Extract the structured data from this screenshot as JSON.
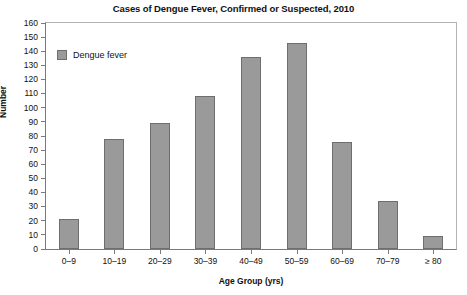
{
  "chart_data": {
    "type": "bar",
    "title": "Cases of Dengue Fever, Confirmed or Suspected, 2010",
    "xlabel": "Age Group (yrs)",
    "ylabel": "Number",
    "categories": [
      "0–9",
      "10–19",
      "20–29",
      "30–39",
      "40–49",
      "50–59",
      "60–69",
      "70–79",
      "≥ 80"
    ],
    "values": [
      21,
      78,
      89,
      108,
      136,
      146,
      76,
      34,
      9
    ],
    "series": [
      {
        "name": "Dengue fever",
        "values": [
          21,
          78,
          89,
          108,
          136,
          146,
          76,
          34,
          9
        ]
      }
    ],
    "ylim": [
      0,
      160
    ],
    "ytick_step": 10,
    "yticks": [
      0,
      10,
      20,
      30,
      40,
      50,
      60,
      70,
      80,
      90,
      100,
      110,
      120,
      130,
      140,
      150,
      160
    ],
    "ytick_labels": [
      "0",
      "10",
      "20",
      "30",
      "40",
      "50",
      "60",
      "70",
      "80",
      "90",
      "100",
      "110",
      "120",
      "130",
      "140",
      "150",
      "160"
    ],
    "grid": false,
    "legend": {
      "position": "inside-top-left",
      "entries": [
        {
          "label": "Dengue fever",
          "color": "#9a9a9a"
        }
      ]
    },
    "colors": {
      "bar_fill": "#9a9a9a",
      "bar_border": "#6e6e6e",
      "axis": "#7a7a7a",
      "frame": "#b3b3b3",
      "text": "#111111",
      "background": "#ffffff"
    }
  }
}
